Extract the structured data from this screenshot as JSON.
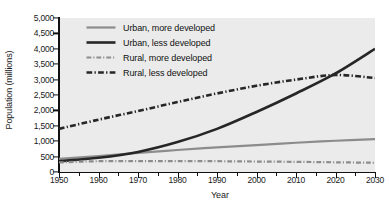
{
  "chart_data": {
    "type": "line",
    "title": "",
    "xlabel": "Year",
    "ylabel": "Population (millions)",
    "xlim": [
      1950,
      2030
    ],
    "ylim": [
      0,
      5000
    ],
    "xticks": [
      1950,
      1960,
      1970,
      1980,
      1990,
      2000,
      2010,
      2020,
      2030
    ],
    "xtick_labels": [
      "1950",
      "1960",
      "1970",
      "1980",
      "1990",
      "2000",
      "2010",
      "2020",
      "2030"
    ],
    "yticks": [
      0,
      500,
      1000,
      1500,
      2000,
      2500,
      3000,
      3500,
      4000,
      4500,
      5000
    ],
    "ytick_labels": [
      "0",
      "500",
      "1,000",
      "1,500",
      "2,000",
      "2,500",
      "3,000",
      "3,500",
      "4,000",
      "4,500",
      "5,000"
    ],
    "grid": false,
    "legend_position": "upper-left",
    "x": [
      1950,
      1960,
      1970,
      1980,
      1990,
      2000,
      2010,
      2020,
      2030
    ],
    "series": [
      {
        "name": "Urban, more developed",
        "label": "Urban, more developed",
        "style": "solid",
        "color": "#8c8c8c",
        "width": 2.2,
        "values": [
          425,
          520,
          620,
          715,
          800,
          875,
          950,
          1015,
          1070
        ]
      },
      {
        "name": "Urban, less developed",
        "label": "Urban, less developed",
        "style": "solid",
        "color": "#262626",
        "width": 2.6,
        "values": [
          350,
          460,
          650,
          970,
          1400,
          1950,
          2550,
          3200,
          4000
        ]
      },
      {
        "name": "Rural, more developed",
        "label": "Rural, more developed",
        "style": "dash-dot",
        "color": "#8c8c8c",
        "width": 2.2,
        "values": [
          310,
          350,
          355,
          355,
          350,
          340,
          330,
          315,
          300
        ]
      },
      {
        "name": "Rural, less developed",
        "label": "Rural, less developed",
        "style": "dash-dot",
        "color": "#262626",
        "width": 2.6,
        "values": [
          1400,
          1700,
          1980,
          2270,
          2550,
          2800,
          3000,
          3150,
          3050
        ]
      }
    ],
    "annotations": {
      "crossover_urban_less_vs_rural_less_year": 2018,
      "rural_less_peak_year": 2018,
      "rural_less_peak_value": 3150
    },
    "colors": {
      "plot_background": "#ebebeb",
      "axis": "#111111",
      "gray_series": "#8c8c8c",
      "black_series": "#262626",
      "text": "#1a1a1a"
    }
  }
}
